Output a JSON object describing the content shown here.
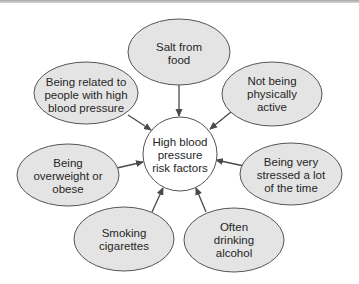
{
  "diagram": {
    "center": {
      "lines": [
        "High blood",
        "pressure",
        "risk factors"
      ]
    },
    "nodes": [
      {
        "id": "salt",
        "lines": [
          "Salt from",
          "food"
        ]
      },
      {
        "id": "related",
        "lines": [
          "Being related to",
          "people with high",
          "blood pressure"
        ]
      },
      {
        "id": "inactive",
        "lines": [
          "Not being",
          "physically",
          "active"
        ]
      },
      {
        "id": "overweight",
        "lines": [
          "Being",
          "overweight or",
          "obese"
        ]
      },
      {
        "id": "stressed",
        "lines": [
          "Being very",
          "stressed a lot",
          "of the time"
        ]
      },
      {
        "id": "smoking",
        "lines": [
          "Smoking",
          "cigarettes"
        ]
      },
      {
        "id": "alcohol",
        "lines": [
          "Often",
          "drinking",
          "alcohol"
        ]
      }
    ],
    "colors": {
      "node_fill": "#e4e4e4",
      "center_fill": "#ffffff",
      "stroke": "#555555",
      "text": "#262626"
    }
  }
}
